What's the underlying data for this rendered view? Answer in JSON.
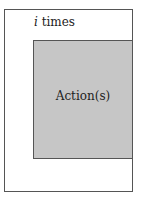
{
  "diagram": {
    "type": "loop-diagram",
    "loop": {
      "variable": "i",
      "suffix": " times"
    },
    "action": {
      "label": "Action(s)"
    },
    "colors": {
      "outer_fill": "#ffffff",
      "action_fill": "#c6c6c6",
      "border": "#555555",
      "text": "#222222"
    }
  }
}
